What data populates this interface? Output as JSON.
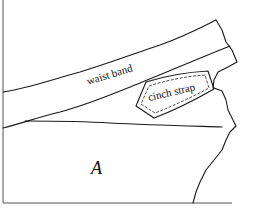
{
  "diagram": {
    "type": "sewing-pattern-sketch",
    "labels": {
      "waistband": "waist band",
      "cinch_strap": "cinch strap",
      "piece": "A"
    },
    "colors": {
      "line": "#1a1a1a",
      "background": "#ffffff"
    }
  }
}
